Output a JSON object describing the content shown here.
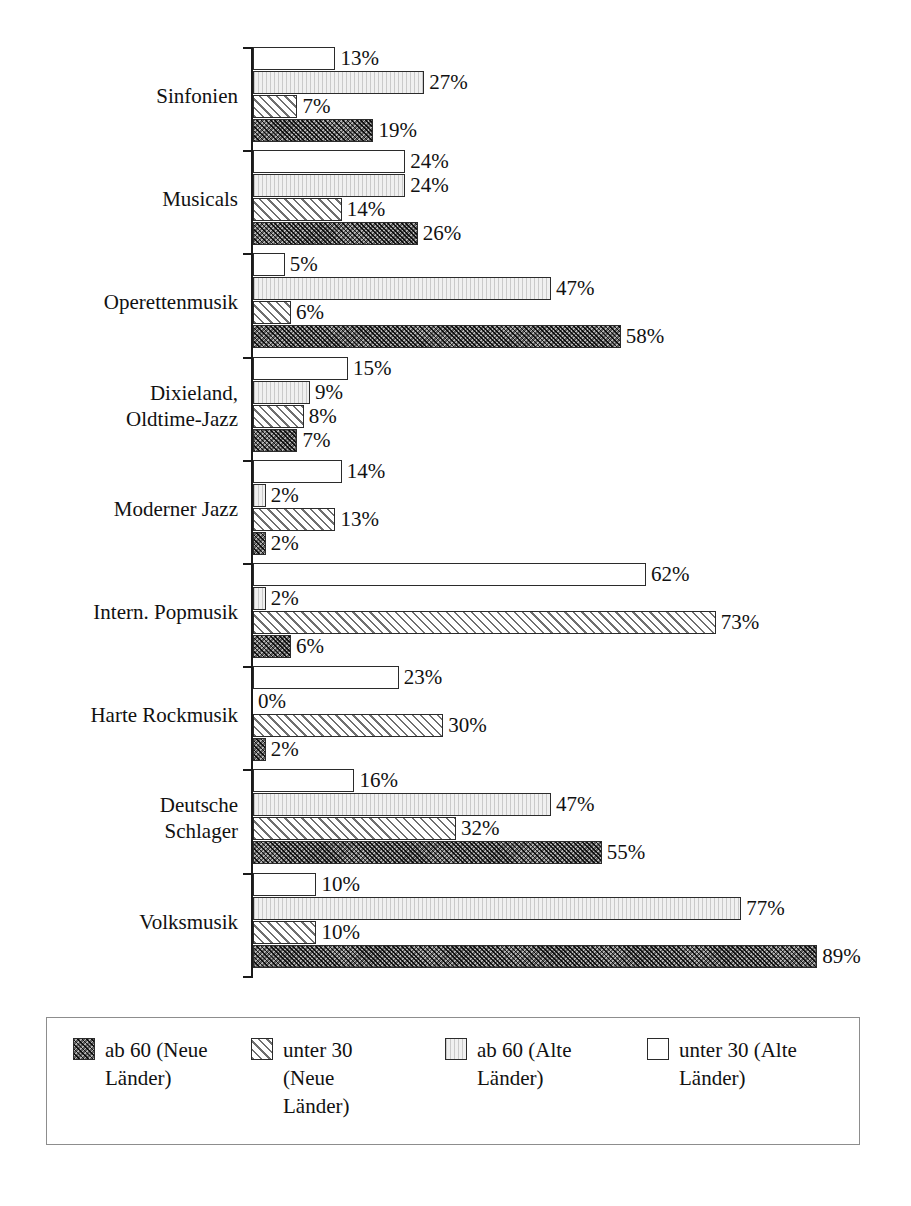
{
  "chart_data": {
    "type": "bar",
    "orientation": "horizontal",
    "title": "",
    "subtitle": "",
    "xlabel": "",
    "ylabel": "",
    "xlim": [
      0,
      100
    ],
    "grid": false,
    "value_suffix": "%",
    "legend_position": "bottom",
    "axis_scale_px_per_percent": 6.34,
    "categories": [
      "Sinfonien",
      "Musicals",
      "Operettenmusik",
      "Dixieland,\nOldtime-Jazz",
      "Moderner Jazz",
      "Intern. Popmusik",
      "Harte Rockmusik",
      "Deutsche\nSchlager",
      "Volksmusik"
    ],
    "series": [
      {
        "name": "unter 30 (Alte Länder)",
        "pattern": "solid-white",
        "values": [
          13,
          24,
          5,
          15,
          14,
          62,
          23,
          16,
          10
        ]
      },
      {
        "name": "ab 60 (Alte Länder)",
        "pattern": "light-gray-vertical",
        "values": [
          27,
          24,
          47,
          9,
          2,
          2,
          0,
          47,
          77
        ]
      },
      {
        "name": "unter 30 (Neue Länder)",
        "pattern": "diagonal-hatch",
        "values": [
          7,
          14,
          6,
          8,
          13,
          73,
          30,
          32,
          10
        ]
      },
      {
        "name": "ab 60 (Neue Länder)",
        "pattern": "dark-checker",
        "values": [
          19,
          26,
          58,
          7,
          2,
          6,
          2,
          55,
          89
        ]
      }
    ],
    "data_labels": [
      [
        "13%",
        "27%",
        "7%",
        "19%"
      ],
      [
        "24%",
        "24%",
        "14%",
        "26%"
      ],
      [
        "5%",
        "47%",
        "6%",
        "58%"
      ],
      [
        "15%",
        "9%",
        "8%",
        "7%"
      ],
      [
        "14%",
        "2%",
        "13%",
        "2%"
      ],
      [
        "62%",
        "2%",
        "73%",
        "6%"
      ],
      [
        "23%",
        "0%",
        "30%",
        "2%"
      ],
      [
        "16%",
        "47%",
        "32%",
        "55%"
      ],
      [
        "10%",
        "77%",
        "10%",
        "89%"
      ]
    ]
  },
  "legend": {
    "items": [
      {
        "label": "ab 60 (Neue Länder)",
        "series_index": 3,
        "pattern": "dark-checker"
      },
      {
        "label": "unter 30 (Neue Länder)",
        "series_index": 2,
        "pattern": "diagonal-hatch"
      },
      {
        "label": "ab 60 (Alte Länder)",
        "series_index": 1,
        "pattern": "light-gray-vertical"
      },
      {
        "label": "unter 30 (Alte Länder)",
        "series_index": 0,
        "pattern": "solid-white"
      }
    ]
  },
  "colors": {
    "axis": "#1a1a1a",
    "bar_outline": "#2b2b2b",
    "text": "#111111",
    "legend_border": "#8d8d8d",
    "series_0_fill": "#ffffff",
    "series_1_fill": "#f0f0f0",
    "series_2_fill": "#e8e8e8",
    "series_3_fill": "#5d5d5d",
    "background": "#ffffff"
  }
}
